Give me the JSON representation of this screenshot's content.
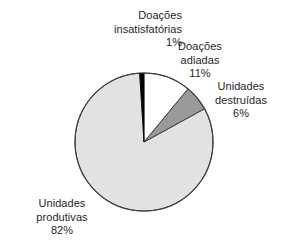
{
  "chart_data": {
    "type": "pie",
    "title": "",
    "xlabel": "",
    "ylabel": "",
    "legend_position": "none",
    "grid": false,
    "unit": "%",
    "start_angle_deg": 0,
    "direction": "clockwise",
    "categories": [
      "Doações insatisfatórias",
      "Doações adiadas",
      "Unidades destruídas",
      "Unidades produtivas"
    ],
    "values": [
      1,
      11,
      6,
      82
    ],
    "colors": [
      "#000000",
      "#ffffff",
      "#9a9a9a",
      "#e2e2e2"
    ],
    "slices": [
      {
        "name": "doacoes-insatisfatorias",
        "label_line_1": "Doações",
        "label_line_2": "insatisfatórias",
        "value_label": "1%",
        "value": 1,
        "color": "#000000"
      },
      {
        "name": "doacoes-adiadas",
        "label_line_1": "Doações",
        "label_line_2": "adiadas",
        "value_label": "11%",
        "value": 11,
        "color": "#ffffff"
      },
      {
        "name": "unidades-destruidas",
        "label_line_1": "Unidades",
        "label_line_2": "destruídas",
        "value_label": "6%",
        "value": 6,
        "color": "#9a9a9a"
      },
      {
        "name": "unidades-produtivas",
        "label_line_1": "Unidades",
        "label_line_2": "produtivas",
        "value_label": "82%",
        "value": 82,
        "color": "#e2e2e2"
      }
    ]
  },
  "style": {
    "background": "#ffffff",
    "outline": "#3d3d3d",
    "text": "#1f1f1f"
  }
}
